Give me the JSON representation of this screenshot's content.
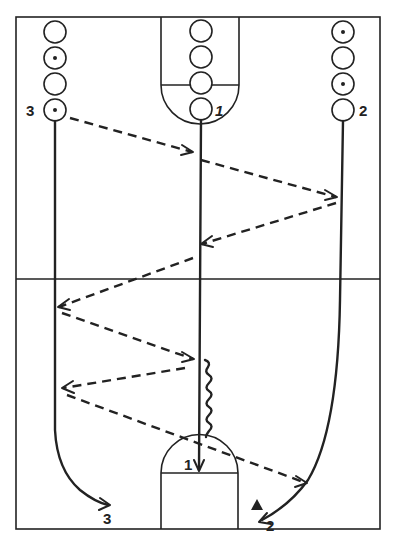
{
  "diagram": {
    "type": "basketball-drill",
    "court": {
      "outline": "full-court",
      "midcourt_line": true,
      "top_key": true,
      "bottom_key": true
    },
    "lines": {
      "left": {
        "label": "3",
        "players": 4,
        "with_ball": [
          2,
          4
        ]
      },
      "middle": {
        "label": "1",
        "players": 4,
        "with_ball": []
      },
      "right": {
        "label": "2",
        "players": 4,
        "with_ball": [
          1,
          3
        ]
      }
    },
    "labels": {
      "left_line": "3",
      "middle_line": "1",
      "right_line": "2",
      "end_left": "3",
      "end_middle": "1",
      "end_right": "2"
    },
    "legend": {
      "solid_line": "cut / player path",
      "dashed_line": "pass",
      "wavy_line": "dribble",
      "triangle": "shot"
    },
    "colors": {
      "ink": "#222222",
      "background": "#ffffff"
    }
  }
}
